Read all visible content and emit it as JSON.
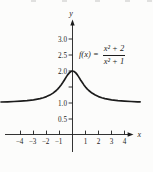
{
  "colors": {
    "axis": "#1c1c1c",
    "curve": "#1c1c1c",
    "text": "#1c1c1c",
    "background": "#fcfcfb"
  },
  "figure": {
    "formula": {
      "lhs": "f(x) =",
      "numerator": "x² + 2",
      "denominator": "x² + 1"
    }
  },
  "chart_data": {
    "type": "line",
    "title": "",
    "function_label": "f(x) = (x² + 2)/(x² + 1)",
    "xlabel": "x",
    "ylabel": "y",
    "xlim": [
      -5.5,
      5.3
    ],
    "ylim": [
      0,
      3.45
    ],
    "grid": false,
    "legend": false,
    "x_ticks": [
      {
        "v": -4,
        "label": "−4"
      },
      {
        "v": -3,
        "label": "−3"
      },
      {
        "v": -2,
        "label": "−2"
      },
      {
        "v": -1,
        "label": "−1"
      },
      {
        "v": 1,
        "label": "1"
      },
      {
        "v": 2,
        "label": "2"
      },
      {
        "v": 3,
        "label": "3"
      },
      {
        "v": 4,
        "label": "4"
      }
    ],
    "y_ticks": [
      {
        "v": 3.0,
        "label": "3.0"
      },
      {
        "v": 2.5,
        "label": "2.5"
      },
      {
        "v": 2.0,
        "label": "2.0"
      },
      {
        "v": 1.5,
        "label": ""
      },
      {
        "v": 1.0,
        "label": "1.0"
      },
      {
        "v": 0.5,
        "label": "0.5"
      }
    ],
    "annotations": [
      {
        "text": "f(x) = (x² + 2)/(x² + 1)",
        "position": "upper-right"
      }
    ],
    "series": [
      {
        "name": "f(x) = (x² + 2)/(x² + 1)",
        "points": [
          [
            -5.5,
            1.032
          ],
          [
            -5.0,
            1.038
          ],
          [
            -4.5,
            1.047
          ],
          [
            -4.0,
            1.059
          ],
          [
            -3.5,
            1.075
          ],
          [
            -3.0,
            1.1
          ],
          [
            -2.5,
            1.138
          ],
          [
            -2.25,
            1.166
          ],
          [
            -2.0,
            1.2
          ],
          [
            -1.75,
            1.246
          ],
          [
            -1.5,
            1.308
          ],
          [
            -1.25,
            1.39
          ],
          [
            -1.125,
            1.441
          ],
          [
            -1.0,
            1.5
          ],
          [
            -0.875,
            1.566
          ],
          [
            -0.75,
            1.64
          ],
          [
            -0.625,
            1.719
          ],
          [
            -0.5,
            1.8
          ],
          [
            -0.375,
            1.877
          ],
          [
            -0.25,
            1.941
          ],
          [
            -0.125,
            1.985
          ],
          [
            0,
            2.0
          ],
          [
            0.125,
            1.985
          ],
          [
            0.25,
            1.941
          ],
          [
            0.375,
            1.877
          ],
          [
            0.5,
            1.8
          ],
          [
            0.625,
            1.719
          ],
          [
            0.75,
            1.64
          ],
          [
            0.875,
            1.566
          ],
          [
            1.0,
            1.5
          ],
          [
            1.125,
            1.441
          ],
          [
            1.25,
            1.39
          ],
          [
            1.5,
            1.308
          ],
          [
            1.75,
            1.246
          ],
          [
            2.0,
            1.2
          ],
          [
            2.25,
            1.166
          ],
          [
            2.5,
            1.138
          ],
          [
            3.0,
            1.1
          ],
          [
            3.5,
            1.075
          ],
          [
            4.0,
            1.059
          ],
          [
            4.5,
            1.047
          ],
          [
            5.0,
            1.038
          ],
          [
            5.2,
            1.035
          ]
        ]
      }
    ]
  }
}
